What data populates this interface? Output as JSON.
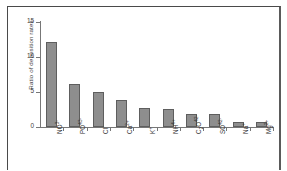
{
  "chart_data": {
    "type": "bar",
    "title": "",
    "subtitle": "",
    "xlabel": "",
    "ylabel": "Ratio of deposition rates",
    "categories": [
      "NO3-",
      "PO43-",
      "Cl-",
      "Ca2+",
      "K+",
      "NH4+",
      "C2O42-",
      "SO42-",
      "Na+",
      "Mg2+"
    ],
    "values": [
      12.1,
      6.1,
      5.0,
      3.9,
      2.7,
      2.6,
      1.85,
      1.85,
      0.75,
      0.75
    ],
    "ylim": [
      0,
      15
    ],
    "yticks": [
      0,
      5,
      10,
      15
    ],
    "ytick_labels": [
      "0",
      "5",
      "10",
      "15"
    ],
    "grid": false,
    "legend": false,
    "legend_position": "none",
    "bar_color": "#8e8e8e",
    "bar_edge_color": "#5e5e5e",
    "axis_color": "#777777",
    "text_color": "#333333",
    "frame_color": "#4a4a4a",
    "background": "#ffffff"
  }
}
